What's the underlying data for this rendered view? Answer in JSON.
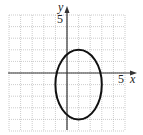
{
  "chart_data": {
    "type": "line",
    "title": "",
    "xlabel": "x",
    "ylabel": "y",
    "xlim": [
      -5,
      5
    ],
    "ylim": [
      -5,
      5
    ],
    "grid": true,
    "tick_labels": {
      "x": [
        "5"
      ],
      "y": [
        "5"
      ]
    },
    "series": [
      {
        "name": "ellipse",
        "shape": "ellipse",
        "center": [
          1,
          -1
        ],
        "semi_axis_x": 2,
        "semi_axis_y": 3,
        "x_range": [
          -1,
          3
        ],
        "y_range": [
          -4,
          2
        ]
      }
    ]
  },
  "labels": {
    "x_axis": "x",
    "y_axis": "y",
    "x_tick": "5",
    "y_tick": "5"
  },
  "colors": {
    "grid": "#aaaaaa",
    "axis": "#333333",
    "curve": "#111111"
  }
}
